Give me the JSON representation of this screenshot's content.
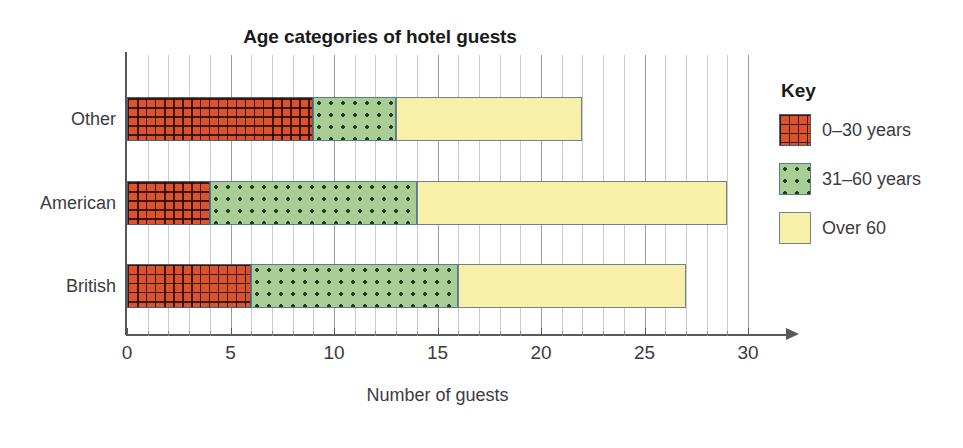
{
  "chart_data": {
    "type": "bar",
    "orientation": "horizontal",
    "stacked": true,
    "title": "Age categories of hotel guests",
    "xlabel": "Number of guests",
    "ylabel": "",
    "categories": [
      "British",
      "American",
      "Other"
    ],
    "categories_top_to_bottom": [
      "Other",
      "American",
      "British"
    ],
    "series": [
      {
        "name": "0–30 years",
        "values": [
          6,
          4,
          9
        ],
        "color": "#d9532c",
        "pattern": "cross-hatch-grid"
      },
      {
        "name": "31–60 years",
        "values": [
          10,
          10,
          4
        ],
        "color": "#a8ce96",
        "pattern": "dots"
      },
      {
        "name": "Over 60",
        "values": [
          11,
          15,
          9
        ],
        "color": "#f8f0a8",
        "pattern": "solid"
      }
    ],
    "totals": [
      27,
      29,
      22
    ],
    "cumulative_edges": {
      "British": [
        6,
        16,
        27
      ],
      "American": [
        4,
        14,
        29
      ],
      "Other": [
        9,
        13,
        22
      ]
    },
    "xlim": [
      0,
      30
    ],
    "xticks": [
      0,
      5,
      10,
      15,
      20,
      25,
      30
    ],
    "xtick_labels": [
      "0",
      "5",
      "10",
      "15",
      "20",
      "25",
      "30"
    ],
    "minor_tick_step": 1,
    "grid": "vertical-minor-and-major",
    "legend_position": "right",
    "legend_title": "Key"
  },
  "axis": {
    "x_label": "Number of guests",
    "tick_labels": [
      "0",
      "5",
      "10",
      "15",
      "20",
      "25",
      "30"
    ],
    "category_labels": [
      "Other",
      "American",
      "British"
    ]
  },
  "legend": {
    "title": "Key",
    "items": [
      {
        "label": "0–30 years",
        "color": "#d9532c"
      },
      {
        "label": "31–60 years",
        "color": "#a8ce96"
      },
      {
        "label": "Over 60",
        "color": "#f8f0a8"
      }
    ]
  },
  "title": "Age categories of hotel guests"
}
